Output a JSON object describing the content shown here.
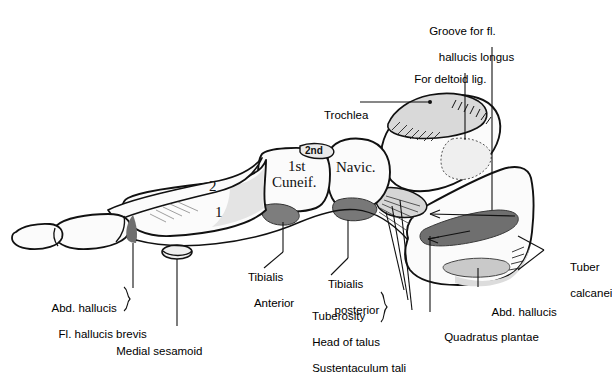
{
  "figure": {
    "background_color": "#ffffff",
    "ink_color": "#000000",
    "bone_fill_light": "#d9d9d9",
    "bone_fill_white": "#f7f7f7",
    "attachment_fill_dark": "#6f6f6f",
    "attachment_fill_mid": "#9a9a9a"
  },
  "bone_labels": [
    {
      "id": "first-cuneiform",
      "text": "1st",
      "x": 288,
      "y": 165
    },
    {
      "id": "cuneiform-word",
      "text": "Cuneif.",
      "x": 278,
      "y": 181
    },
    {
      "id": "second-cuneiform",
      "text": "2nd",
      "x": 307,
      "y": 148
    },
    {
      "id": "navicular",
      "text": "Navic.",
      "x": 340,
      "y": 166
    },
    {
      "id": "metatarsal-two",
      "text": "2",
      "x": 209,
      "y": 186
    },
    {
      "id": "metatarsal-one",
      "text": "1",
      "x": 215,
      "y": 212
    }
  ],
  "callouts": [
    {
      "id": "groove-fl-hallucis-longus",
      "lines": [
        "Groove for fl.",
        "   hallucis longus"
      ],
      "x": 410,
      "y": 12,
      "align": "left"
    },
    {
      "id": "for-deltoid-lig",
      "lines": [
        "For deltoid lig."
      ],
      "x": 395,
      "y": 60,
      "align": "left"
    },
    {
      "id": "trochlea",
      "lines": [
        "Trochlea"
      ],
      "x": 305,
      "y": 96,
      "align": "left"
    },
    {
      "id": "tibialis-anterior",
      "lines": [
        "Tibialis",
        "  Anterior"
      ],
      "x": 229,
      "y": 258,
      "align": "left"
    },
    {
      "id": "tibialis-posterior",
      "lines": [
        "Tibialis",
        "  posterior"
      ],
      "x": 309,
      "y": 265,
      "align": "left"
    },
    {
      "id": "tuberosity-head-sustentaculum",
      "lines": [
        "Tuberosity",
        "Head of talus",
        "Sustentaculum tali"
      ],
      "x": 293,
      "y": 297,
      "align": "left"
    },
    {
      "id": "quadratus-plantae",
      "lines": [
        "Quadratus plantae"
      ],
      "x": 425,
      "y": 318,
      "align": "left"
    },
    {
      "id": "abd-hallucis-right",
      "lines": [
        "Abd. hallucis"
      ],
      "x": 473,
      "y": 293,
      "align": "left"
    },
    {
      "id": "tuber-calcanei",
      "lines": [
        "Tuber",
        "calcanei"
      ],
      "x": 551,
      "y": 248,
      "align": "left"
    },
    {
      "id": "abd-hallucis-fl-hallucis-brevis",
      "lines": [
        "Abd. hallucis",
        "  Fl. hallucis brevis"
      ],
      "x": 33,
      "y": 289,
      "align": "left"
    },
    {
      "id": "medial-sesamoid",
      "lines": [
        "Medial sesamoid"
      ],
      "x": 97,
      "y": 332,
      "align": "left"
    }
  ]
}
